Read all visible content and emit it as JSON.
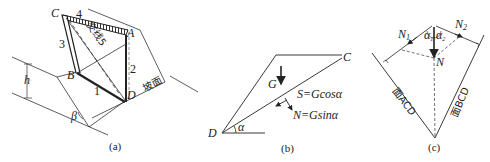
{
  "figure": {
    "panels": [
      {
        "id": "a",
        "caption": "(a)",
        "vertices": {
          "A": "A",
          "B": "B",
          "C": "C",
          "D": "D"
        },
        "edge_numbers": [
          "1",
          "2",
          "3",
          "4"
        ],
        "intersection_label": "交线5",
        "slope_label": "坡面",
        "height_label": "h",
        "angle_label": "β"
      },
      {
        "id": "b",
        "caption": "(b)",
        "vertex_D": "D",
        "vertex_C": "C",
        "weight_label": "G",
        "shear_label": "S=Gcosα",
        "normal_label": "N=Gsinα",
        "angle_label": "α"
      },
      {
        "id": "c",
        "caption": "(c)",
        "n1_label": "N",
        "n1_sub": "1",
        "n2_label": "N",
        "n2_sub": "2",
        "n_label": "N",
        "alpha1": "α",
        "alpha1_sub": "1",
        "alpha2": "α",
        "alpha2_sub": "2",
        "face_acd": "面ACD",
        "face_bcd": "面BCD"
      }
    ]
  }
}
